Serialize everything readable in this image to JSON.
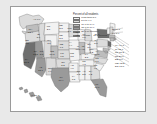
{
  "figure": {
    "type": "choropleth-map",
    "region": "United States",
    "insets": [
      "Alaska",
      "Hawaii"
    ]
  },
  "legend": {
    "title": "Percent of all residents",
    "note_label": "Average = 11.3 percent",
    "items": [
      {
        "swatch": "#f2f2f2",
        "label": "Less than 5.0"
      },
      {
        "swatch": "#dcdcdc",
        "label": "5.0 to 9.9"
      },
      {
        "swatch": "#bdbdbd",
        "label": "10.0 to 14.9"
      },
      {
        "swatch": "#9a9a9a",
        "label": "15.0 to 19.9"
      },
      {
        "swatch": "#6f6f6f",
        "label": "20.0 or more"
      }
    ]
  },
  "chart_data": {
    "type": "heatmap",
    "title": "Percent of all residents",
    "xlabel": "",
    "ylabel": "",
    "legend_position": "top-right",
    "grid": false,
    "categories": [
      "WA",
      "OR",
      "CA",
      "NV",
      "ID",
      "MT",
      "WY",
      "UT",
      "AZ",
      "NM",
      "CO",
      "ND",
      "SD",
      "NE",
      "KS",
      "OK",
      "TX",
      "MN",
      "IA",
      "MO",
      "AR",
      "LA",
      "WI",
      "IL",
      "MI",
      "IN",
      "OH",
      "KY",
      "TN",
      "MS",
      "AL",
      "GA",
      "FL",
      "SC",
      "NC",
      "VA",
      "WV",
      "PA",
      "NY",
      "ME",
      "VT",
      "NH",
      "MA",
      "RI",
      "CT",
      "NJ",
      "DE",
      "MD",
      "DC",
      "AK",
      "HI"
    ],
    "values": [
      12.4,
      9.7,
      27.2,
      18.8,
      5.9,
      2.0,
      3.1,
      8.3,
      15.1,
      9.9,
      10.3,
      2.3,
      2.3,
      6.1,
      6.5,
      5.2,
      16.4,
      6.6,
      4.4,
      3.8,
      4.0,
      3.8,
      4.5,
      13.7,
      6.0,
      4.5,
      3.9,
      2.8,
      4.3,
      1.8,
      2.8,
      9.2,
      19.0,
      4.7,
      7.0,
      10.8,
      1.2,
      5.6,
      21.6,
      3.3,
      3.9,
      5.3,
      14.1,
      12.6,
      13.2,
      20.1,
      8.1,
      12.2,
      13.0,
      6.9,
      16.3
    ],
    "class_breaks": [
      0,
      5.0,
      10.0,
      15.0,
      20.0
    ],
    "average": 11.3
  },
  "state_labels": [
    {
      "ab": "WA",
      "value": "12.4",
      "x": 19.5,
      "y": 25.0
    },
    {
      "ab": "OR",
      "value": "9.7",
      "x": 16.0,
      "y": 36.0
    },
    {
      "ab": "CA",
      "value": "27.2",
      "x": 15.5,
      "y": 55.0
    },
    {
      "ab": "NV",
      "value": "18.8",
      "x": 24.5,
      "y": 47.0
    },
    {
      "ab": "ID",
      "value": "5.9",
      "x": 27.5,
      "y": 30.0
    },
    {
      "ab": "MT",
      "value": "2.0",
      "x": 37.5,
      "y": 22.0
    },
    {
      "ab": "WY",
      "value": "3.1",
      "x": 38.0,
      "y": 36.0
    },
    {
      "ab": "UT",
      "value": "8.3",
      "x": 30.5,
      "y": 47.0
    },
    {
      "ab": "AZ",
      "value": "15.1",
      "x": 29.5,
      "y": 63.0
    },
    {
      "ab": "NM",
      "value": "9.9",
      "x": 39.0,
      "y": 64.0
    },
    {
      "ab": "CO",
      "value": "10.3",
      "x": 41.0,
      "y": 47.0
    },
    {
      "ab": "ND",
      "value": "2.3",
      "x": 50.0,
      "y": 21.0
    },
    {
      "ab": "SD",
      "value": "2.3",
      "x": 50.0,
      "y": 31.0
    },
    {
      "ab": "NE",
      "value": "6.1",
      "x": 50.5,
      "y": 40.0
    },
    {
      "ab": "KS",
      "value": "6.5",
      "x": 51.0,
      "y": 49.0
    },
    {
      "ab": "OK",
      "value": "5.2",
      "x": 52.0,
      "y": 58.0
    },
    {
      "ab": "TX",
      "value": "16.4",
      "x": 50.0,
      "y": 73.0
    },
    {
      "ab": "MN",
      "value": "6.6",
      "x": 58.5,
      "y": 24.0
    },
    {
      "ab": "IA",
      "value": "4.4",
      "x": 59.5,
      "y": 38.0
    },
    {
      "ab": "MO",
      "value": "3.8",
      "x": 61.0,
      "y": 49.0
    },
    {
      "ab": "AR",
      "value": "4.0",
      "x": 61.0,
      "y": 61.0
    },
    {
      "ab": "LA",
      "value": "3.8",
      "x": 62.5,
      "y": 72.0
    },
    {
      "ab": "WI",
      "value": "4.5",
      "x": 66.0,
      "y": 28.0
    },
    {
      "ab": "IL",
      "value": "13.7",
      "x": 67.0,
      "y": 42.0
    },
    {
      "ab": "MI",
      "value": "6.0",
      "x": 73.0,
      "y": 30.0
    },
    {
      "ab": "IN",
      "value": "4.5",
      "x": 72.0,
      "y": 42.0
    },
    {
      "ab": "OH",
      "value": "3.9",
      "x": 78.0,
      "y": 40.0
    },
    {
      "ab": "KY",
      "value": "2.8",
      "x": 75.5,
      "y": 50.0
    },
    {
      "ab": "TN",
      "value": "4.3",
      "x": 73.0,
      "y": 57.0
    },
    {
      "ab": "MS",
      "value": "1.8",
      "x": 67.5,
      "y": 67.0
    },
    {
      "ab": "AL",
      "value": "2.8",
      "x": 73.0,
      "y": 67.0
    },
    {
      "ab": "GA",
      "value": "9.2",
      "x": 79.5,
      "y": 67.0
    },
    {
      "ab": "FL",
      "value": "19.0",
      "x": 86.0,
      "y": 80.0
    },
    {
      "ab": "SC",
      "value": "4.7",
      "x": 84.5,
      "y": 61.0
    },
    {
      "ab": "NC",
      "value": "7.0",
      "x": 86.0,
      "y": 54.0
    },
    {
      "ab": "VA",
      "value": "10.8",
      "x": 86.0,
      "y": 47.0
    },
    {
      "ab": "WV",
      "value": "1.2",
      "x": 80.5,
      "y": 45.0
    },
    {
      "ab": "PA",
      "value": "5.6",
      "x": 85.0,
      "y": 36.0
    },
    {
      "ab": "NY",
      "value": "21.6",
      "x": 86.0,
      "y": 27.0
    }
  ],
  "callouts": [
    {
      "text": "NH 5.3",
      "x": 101.0,
      "y": 22.0
    },
    {
      "text": "VT 3.9",
      "x": 101.0,
      "y": 25.5
    },
    {
      "text": "MA 14.1",
      "x": 104.0,
      "y": 38.0
    },
    {
      "text": "RI 12.6",
      "x": 104.0,
      "y": 41.5
    },
    {
      "text": "CT 13.2",
      "x": 104.0,
      "y": 45.0
    },
    {
      "text": "NJ 20.1",
      "x": 104.0,
      "y": 48.5
    },
    {
      "text": "DE 8.1",
      "x": 104.0,
      "y": 52.0
    },
    {
      "text": "MD 12.2",
      "x": 104.0,
      "y": 55.5
    },
    {
      "text": "DC 13.0",
      "x": 104.0,
      "y": 59.0
    }
  ],
  "inset_labels": [
    {
      "text": "AK 6.9",
      "x": 22.0,
      "y": 12.0
    },
    {
      "text": "HI 16.3",
      "x": 20.0,
      "y": 88.0
    }
  ]
}
